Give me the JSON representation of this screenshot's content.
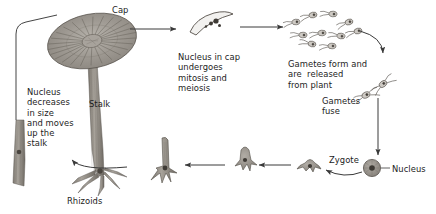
{
  "diagram": {
    "organism": "Acetabularia (green alga)",
    "background_color": "#ffffff",
    "ink_color": "#3a3a3a",
    "text_color": "#1c1c1c",
    "labels": [
      {
        "id": "cap",
        "text": "Cap",
        "x": 112,
        "y": 5,
        "align": "left"
      },
      {
        "id": "mitosis",
        "text": "Nucleus in cap\nundergoes\nmitosis and\nmeiosis",
        "x": 178,
        "y": 52,
        "align": "left"
      },
      {
        "id": "gametes-form",
        "text": "Gametes form and\nare  released\nfrom plant",
        "x": 288,
        "y": 59,
        "align": "left"
      },
      {
        "id": "gametes-fuse",
        "text": "Gametes\nfuse",
        "x": 322,
        "y": 96,
        "align": "left"
      },
      {
        "id": "zygote",
        "text": "Zygote",
        "x": 329,
        "y": 155,
        "align": "left"
      },
      {
        "id": "nucleus-zygote",
        "text": "Nucleus",
        "x": 392,
        "y": 164,
        "align": "left"
      },
      {
        "id": "rhizoids",
        "text": "Rhizoids",
        "x": 67,
        "y": 196,
        "align": "left"
      },
      {
        "id": "stalk",
        "text": "Stalk",
        "x": 89,
        "y": 99,
        "align": "left"
      },
      {
        "id": "nucleus-moves",
        "text": "Nucleus\ndecreases\nin size\nand moves\nup the\nstalk",
        "x": 27,
        "y": 87,
        "align": "left"
      }
    ],
    "stages": [
      {
        "id": "mature-plant",
        "name": "Mature plant with cap, stalk and rhizoids"
      },
      {
        "id": "cap-section",
        "name": "Cap section containing nuclei undergoing mitosis and meiosis"
      },
      {
        "id": "free-gametes",
        "name": "Flagellated gametes released from the plant"
      },
      {
        "id": "fusing-gametes",
        "name": "Pairs of gametes fusing"
      },
      {
        "id": "zygote-cell",
        "name": "Zygote with nucleus"
      },
      {
        "id": "germling-small",
        "name": "Small germling with short rhizoids"
      },
      {
        "id": "germling-medium",
        "name": "Germling with developing stalk"
      },
      {
        "id": "germling-large",
        "name": "Young plant with elongating stalk and rhizoids"
      },
      {
        "id": "stalk-fragment",
        "name": "Stalk with nucleus migrating upward"
      }
    ],
    "arrows": [
      {
        "id": "plant-to-capsection",
        "from": "mature-plant",
        "to": "cap-section"
      },
      {
        "id": "capsection-to-gametes",
        "from": "cap-section",
        "to": "free-gametes"
      },
      {
        "id": "gametes-to-fusion",
        "from": "free-gametes",
        "to": "fusing-gametes"
      },
      {
        "id": "fusion-to-zygote",
        "from": "fusing-gametes",
        "to": "zygote-cell"
      },
      {
        "id": "zygote-to-germling",
        "from": "zygote-cell",
        "to": "germling-small"
      },
      {
        "id": "germling-growth-1",
        "from": "germling-small",
        "to": "germling-medium"
      },
      {
        "id": "germling-growth-2",
        "from": "germling-medium",
        "to": "germling-large"
      },
      {
        "id": "germling-to-fragment",
        "from": "germling-large",
        "to": "stalk-fragment"
      },
      {
        "id": "fragment-to-plant",
        "from": "stalk-fragment",
        "to": "mature-plant"
      }
    ]
  }
}
